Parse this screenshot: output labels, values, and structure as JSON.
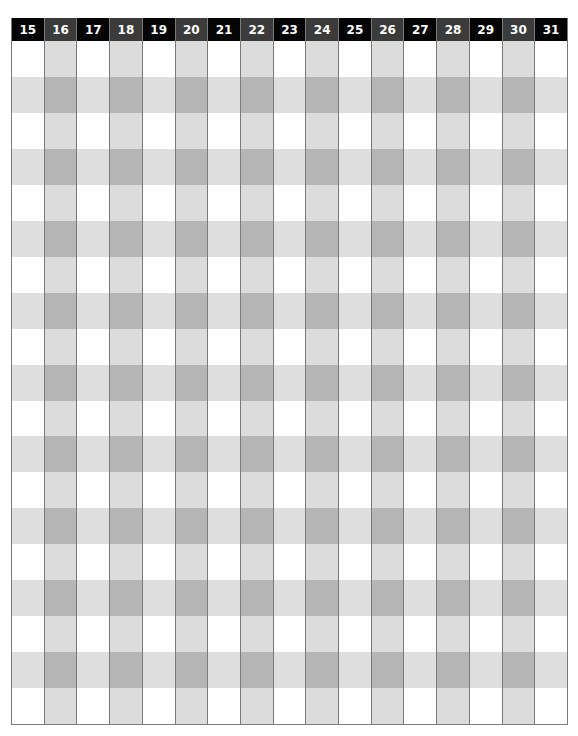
{
  "grid": {
    "columns": [
      "15",
      "16",
      "17",
      "18",
      "19",
      "20",
      "21",
      "22",
      "23",
      "24",
      "25",
      "26",
      "27",
      "28",
      "29",
      "30",
      "31"
    ],
    "row_count": 19,
    "row_pattern": [
      "w",
      "g",
      "w",
      "g",
      "w",
      "g",
      "w",
      "g",
      "w",
      "g",
      "w",
      "g",
      "w",
      "g",
      "w",
      "g",
      "w",
      "g",
      "w"
    ],
    "colors": {
      "header_odd": "#050505",
      "header_even": "#3b3b3b",
      "header_text": "#ffffff",
      "cell_white": "#ffffff",
      "cell_light": "#dedede",
      "cell_dark": "#b5b5b5",
      "border": "#7a7a7a"
    }
  }
}
